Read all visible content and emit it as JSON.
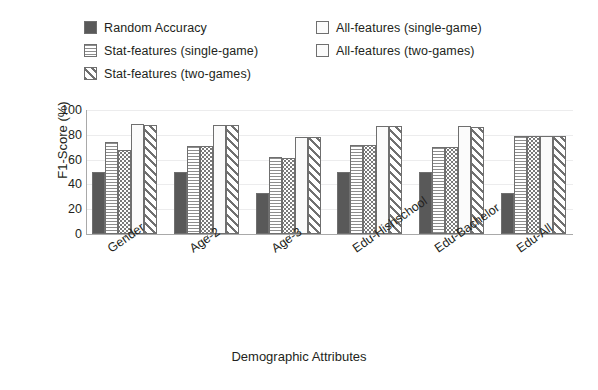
{
  "chart_data": {
    "type": "bar",
    "title": "",
    "xlabel": "Demographic Attributes",
    "ylabel": "F1-Score (%)",
    "ylim": [
      0,
      100
    ],
    "yticks": [
      100,
      80,
      60,
      40,
      20,
      0
    ],
    "grid": true,
    "legend_position": "top",
    "categories": [
      "Gender",
      "Age-2",
      "Age-3",
      "Edu-Hishschool",
      "Edu-Bachelor",
      "Edu-All"
    ],
    "series": [
      {
        "name": "Random Accuracy",
        "pattern": "solid-dark",
        "color": "#595959",
        "values": [
          50,
          50,
          33,
          50,
          50,
          33
        ]
      },
      {
        "name": "Stat-features (single-game)",
        "pattern": "horizontal-lines",
        "color": "#8d8d8d",
        "values": [
          74,
          71,
          62,
          72,
          70,
          79
        ]
      },
      {
        "name": "Stat-features (two-games)",
        "pattern": "dots",
        "color": "#7a7a7a",
        "values": [
          68,
          71,
          61,
          72,
          70,
          79
        ]
      },
      {
        "name": "All-features (single-game)",
        "pattern": "plain-light",
        "color": "#fbfbfb",
        "values": [
          89,
          88,
          78,
          87,
          87,
          79
        ]
      },
      {
        "name": "All-features (two-games)",
        "pattern": "diagonal-hatch",
        "color": "#707070",
        "values": [
          88,
          88,
          78,
          87,
          86,
          79
        ]
      }
    ]
  },
  "legend": {
    "entries": [
      {
        "label": "Random Accuracy",
        "swatch": "solid-dark-swatch"
      },
      {
        "label": "All-features (single-game)",
        "swatch": "plain-light-swatch"
      },
      {
        "label": "Stat-features (single-game)",
        "swatch": "horizontal-lines-swatch"
      },
      {
        "label": "All-features (two-games)",
        "swatch": "plain-white-swatch"
      },
      {
        "label": "Stat-features (two-games)",
        "swatch": "diagonal-hatch-swatch"
      }
    ]
  }
}
